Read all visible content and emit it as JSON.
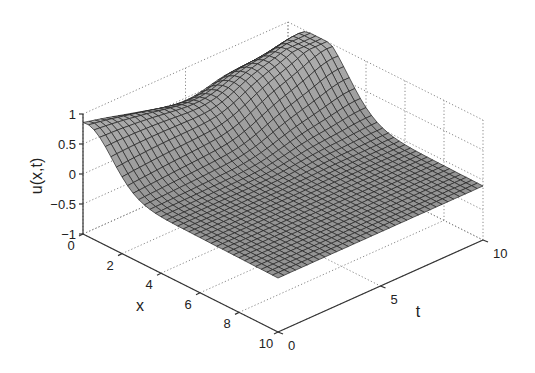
{
  "chart_data": {
    "type": "surface",
    "title": "",
    "xlabel": "x",
    "ylabel": "t",
    "zlabel": "u(x,t)",
    "xlim": [
      0,
      10
    ],
    "ylim": [
      0,
      10
    ],
    "zlim": [
      -1,
      1
    ],
    "x_ticks": [
      "0",
      "2",
      "4",
      "6",
      "8",
      "10"
    ],
    "t_ticks": [
      "0",
      "5",
      "10"
    ],
    "z_ticks": [
      "-1",
      "-0.5",
      "0",
      "0.5",
      "1"
    ],
    "grid": true,
    "grid_style": "dotted",
    "colormap": "gray",
    "mesh_color": "#222222",
    "face_color": "#9a9a9a"
  },
  "labels": {
    "x": "x",
    "t": "t",
    "z": "u(x,t)"
  }
}
